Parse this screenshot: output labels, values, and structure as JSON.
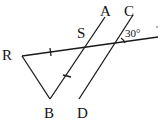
{
  "diagram": {
    "labels": {
      "R": "R",
      "S": "S",
      "A": "A",
      "C": "C",
      "B": "B",
      "D": "D",
      "angle": "30°"
    },
    "colors": {
      "stroke": "#1a1a1a",
      "background": "#ffffff"
    },
    "notes": {
      "equal_marks": "RS and SB marked equal with tick marks",
      "parallel": "AB parallel to CD"
    }
  }
}
